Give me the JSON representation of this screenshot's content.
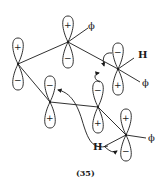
{
  "figure": {
    "caption": "(35)",
    "colors": {
      "stroke": "#1a1a1a",
      "background": "#ffffff"
    }
  },
  "orbitals": [
    {
      "id": "A",
      "cx": 18,
      "cy": 64,
      "top_sign": "+",
      "bottom_sign": "−"
    },
    {
      "id": "B",
      "cx": 68,
      "cy": 42,
      "top_sign": "+",
      "bottom_sign": "−"
    },
    {
      "id": "C",
      "cx": 118,
      "cy": 69,
      "top_sign": "−",
      "bottom_sign": "+"
    },
    {
      "id": "D",
      "cx": 50,
      "cy": 102,
      "top_sign": "−",
      "bottom_sign": "+"
    },
    {
      "id": "E",
      "cx": 98,
      "cy": 107,
      "top_sign": "−",
      "bottom_sign": "+"
    },
    {
      "id": "F",
      "cx": 126,
      "cy": 135,
      "top_sign": "+",
      "bottom_sign": "−"
    }
  ],
  "substituents": {
    "phi_top": "ϕ",
    "phi_right": "ϕ",
    "phi_bottom": "ϕ",
    "h_right": "H",
    "h_bottom": "H"
  }
}
